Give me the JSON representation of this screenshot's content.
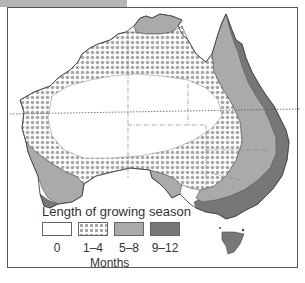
{
  "figure": {
    "title": "Length of growing season",
    "unit_label": "Months",
    "legend": [
      {
        "label": "0",
        "pattern": "blank",
        "color": "#ffffff"
      },
      {
        "label": "1–4",
        "pattern": "dots",
        "color": "#a8a8a8"
      },
      {
        "label": "5–8",
        "pattern": "solid",
        "color": "#aaaaaa"
      },
      {
        "label": "9–12",
        "pattern": "solid",
        "color": "#777777"
      }
    ],
    "region": "Australia"
  }
}
